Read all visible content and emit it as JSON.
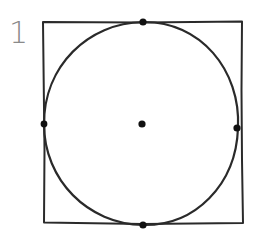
{
  "figure": {
    "label": "1",
    "stroke_color": "#2a2a2a",
    "label_color": "#8a8a8a",
    "square": {
      "x1": 43,
      "y1": 22,
      "x2": 242,
      "y2": 223
    },
    "circle": {
      "cx": 142,
      "cy": 124,
      "r": 99
    },
    "points": [
      {
        "name": "top",
        "x": 143,
        "y": 22
      },
      {
        "name": "left",
        "x": 44,
        "y": 124
      },
      {
        "name": "right",
        "x": 237,
        "y": 128
      },
      {
        "name": "bottom",
        "x": 143,
        "y": 225
      },
      {
        "name": "center",
        "x": 142,
        "y": 124
      }
    ]
  }
}
